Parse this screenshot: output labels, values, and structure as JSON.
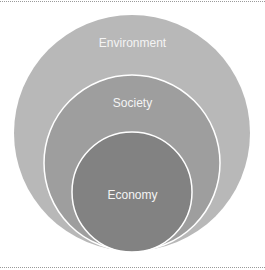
{
  "diagram": {
    "type": "nested-circles",
    "circles": [
      {
        "label": "Environment",
        "fill": "#b8b8b8",
        "cx": 132,
        "cy": 133,
        "r": 118
      },
      {
        "label": "Society",
        "fill": "#9e9e9e",
        "cx": 132,
        "cy": 163,
        "r": 88
      },
      {
        "label": "Economy",
        "fill": "#828282",
        "cx": 132,
        "cy": 192,
        "r": 60
      }
    ],
    "stroke": "#ffffff"
  }
}
